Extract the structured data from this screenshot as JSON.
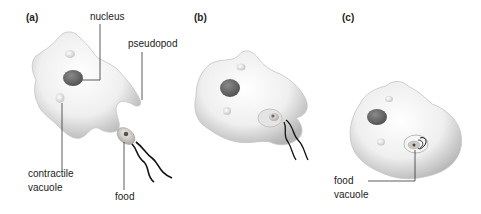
{
  "figure": {
    "panels": [
      {
        "id": "a",
        "label": "(a)",
        "annotations": {
          "nucleus": "nucleus",
          "pseudopod": "pseudopod",
          "contractile_vacuole_line1": "contractile",
          "contractile_vacuole_line2": "vacuole",
          "food": "food"
        }
      },
      {
        "id": "b",
        "label": "(b)"
      },
      {
        "id": "c",
        "label": "(c)",
        "annotations": {
          "food_vacuole_line1": "food",
          "food_vacuole_line2": "vacuole"
        }
      }
    ],
    "colors": {
      "cell_body": "#efefef",
      "cell_shadow": "#b8b8b8",
      "nucleus": "#6e6e6e",
      "leader_line": "#333333",
      "text": "#222222"
    }
  }
}
